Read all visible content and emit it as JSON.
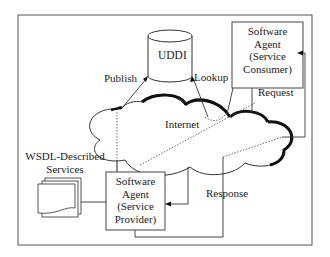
{
  "diagram": {
    "nodes": {
      "uddi": {
        "label": "UDDI"
      },
      "consumer": {
        "lines": [
          "Software",
          "Agent",
          "(Service",
          "Consumer)"
        ]
      },
      "provider": {
        "lines": [
          "Software",
          "Agent",
          "(Service",
          "Provider)"
        ]
      },
      "internet": {
        "label": "Internet"
      },
      "wsdl": {
        "lines": [
          "WSDL-Described",
          "Services"
        ]
      }
    },
    "edges": {
      "publish": "Publish",
      "lookup": "Lookup",
      "request": "Request",
      "response": "Response"
    },
    "colors": {
      "stroke": "#333333",
      "background": "#ffffff"
    }
  }
}
